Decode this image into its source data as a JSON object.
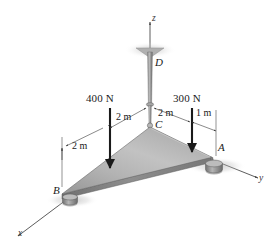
{
  "figure": {
    "background_color": "#ffffff",
    "plate_color_light": "#c9c9c9",
    "plate_color_mid": "#a8a8a8",
    "plate_color_dark": "#8a8a8a",
    "line_color": "#2b2b2b"
  },
  "axes": [
    {
      "name": "z-axis",
      "label": "z"
    },
    {
      "name": "y-axis",
      "label": "y"
    },
    {
      "name": "x-axis",
      "label": "x"
    }
  ],
  "points": [
    {
      "name": "point-d",
      "label": "D"
    },
    {
      "name": "point-c",
      "label": "C"
    },
    {
      "name": "point-a",
      "label": "A"
    },
    {
      "name": "point-b",
      "label": "B"
    }
  ],
  "forces": [
    {
      "name": "force-400n",
      "label": "400 N",
      "magnitude": 400,
      "unit": "N",
      "direction": "down"
    },
    {
      "name": "force-300n",
      "label": "300 N",
      "magnitude": 300,
      "unit": "N",
      "direction": "down"
    }
  ],
  "dimensions": [
    {
      "name": "dim-left-2m",
      "label": "2 m",
      "value": 2,
      "unit": "m"
    },
    {
      "name": "dim-c-left-2m",
      "label": "2 m",
      "value": 2,
      "unit": "m"
    },
    {
      "name": "dim-c-right-2m",
      "label": "2 m",
      "value": 2,
      "unit": "m"
    },
    {
      "name": "dim-right-1m",
      "label": "1 m",
      "value": 1,
      "unit": "m"
    }
  ],
  "supports": [
    {
      "name": "roller-support-a",
      "type": "roller"
    },
    {
      "name": "roller-support-b",
      "type": "roller"
    }
  ],
  "members": [
    {
      "name": "cable-dc",
      "from": "D",
      "to": "C"
    },
    {
      "name": "triangular-plate",
      "vertices": [
        "A",
        "B",
        "C"
      ]
    }
  ]
}
